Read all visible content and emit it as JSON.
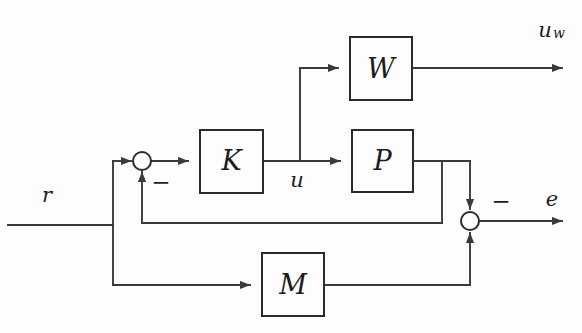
{
  "diagram": {
    "type": "control-system-block-diagram",
    "title": "",
    "background_color": "#fdfdfd",
    "line_color": "#3a3a3a",
    "block_stroke_color": "#2b2b2b",
    "text_color": "#1c1c1c",
    "blocks": [
      {
        "id": "W",
        "label": "W",
        "x": 350,
        "y": 37,
        "w": 62,
        "h": 63
      },
      {
        "id": "K",
        "label": "K",
        "x": 200,
        "y": 130,
        "w": 63,
        "h": 63
      },
      {
        "id": "P",
        "label": "P",
        "x": 352,
        "y": 130,
        "w": 61,
        "h": 62
      },
      {
        "id": "M",
        "label": "M",
        "x": 262,
        "y": 253,
        "w": 62,
        "h": 63
      }
    ],
    "junctions": [
      {
        "id": "sum-left",
        "cx": 142,
        "cy": 161,
        "r": 9
      },
      {
        "id": "sum-right",
        "cx": 470,
        "cy": 221,
        "r": 9
      }
    ],
    "signals": [
      {
        "id": "r",
        "label": "r",
        "x": 47,
        "y": 196
      },
      {
        "id": "u",
        "label": "u",
        "x": 297,
        "y": 181
      },
      {
        "id": "uw",
        "label": "u",
        "subscript": "w",
        "x": 545,
        "y": 31
      },
      {
        "id": "e",
        "label": "e",
        "x": 552,
        "y": 200
      }
    ],
    "signs": [
      {
        "id": "minus-left",
        "label": "−",
        "x": 161,
        "y": 184
      },
      {
        "id": "minus-right",
        "label": "−",
        "x": 501,
        "y": 203
      }
    ]
  }
}
